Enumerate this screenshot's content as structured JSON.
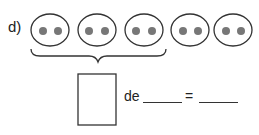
{
  "exercise": {
    "label": "d)",
    "groups": [
      {
        "dots": 2
      },
      {
        "dots": 2
      },
      {
        "dots": 2
      },
      {
        "dots": 2
      },
      {
        "dots": 2
      }
    ],
    "bracketed_groups": 3,
    "equation": {
      "word": "de",
      "equals": "="
    }
  }
}
